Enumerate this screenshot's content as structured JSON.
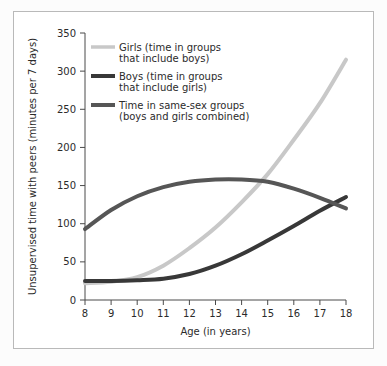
{
  "chart_data": {
    "type": "line",
    "title": "",
    "xlabel": "Age (in years)",
    "ylabel": "Unsupervised time with peers (minutes per 7 days)",
    "xlim": [
      8,
      18
    ],
    "ylim": [
      0,
      350
    ],
    "grid": false,
    "legend_position": "top-left inside plot",
    "x_ticks": [
      "8",
      "9",
      "10",
      "11",
      "12",
      "13",
      "14",
      "15",
      "16",
      "17",
      "18"
    ],
    "y_ticks": [
      "0",
      "50",
      "100",
      "150",
      "200",
      "250",
      "300",
      "350"
    ],
    "x": [
      8,
      9,
      10,
      11,
      12,
      13,
      14,
      15,
      16,
      17,
      18
    ],
    "series": [
      {
        "name": "Girls (time in groups that include boys)",
        "legend_line1": "Girls (time in groups",
        "legend_line2": "that include boys)",
        "color": "#c8c8c8",
        "values": [
          22,
          24,
          30,
          45,
          68,
          95,
          128,
          165,
          210,
          258,
          315
        ]
      },
      {
        "name": "Boys (time in groups that include girls)",
        "legend_line1": "Boys (time in groups",
        "legend_line2": "that include girls)",
        "color": "#383838",
        "values": [
          25,
          25,
          26,
          28,
          34,
          45,
          60,
          78,
          97,
          117,
          135
        ]
      },
      {
        "name": "Time in same-sex groups (boys and girls combined)",
        "legend_line1": "Time in same-sex groups",
        "legend_line2": "(boys and girls combined)",
        "color": "#565656",
        "values": [
          93,
          118,
          136,
          148,
          155,
          158,
          158,
          155,
          146,
          134,
          120
        ]
      }
    ],
    "annotations": [
      "Girls curve crosses same-sex curve near age 15.3 at about 155 minutes",
      "Boys curve crosses same-sex curve near age 17.8 at about 125 minutes"
    ]
  },
  "figure": {
    "border_color": "#b9b9b9",
    "background": "#ffffff"
  }
}
